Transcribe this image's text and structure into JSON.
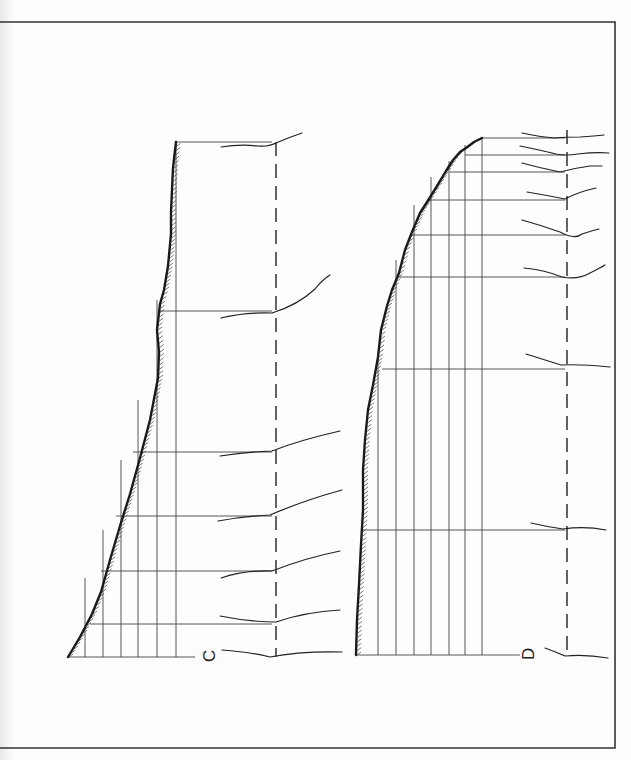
{
  "figure": {
    "frame": {
      "top_y": 22,
      "right_x": 615,
      "bottom_y": 748,
      "left_x": 0
    },
    "panels": [
      {
        "id": "C",
        "label": "C",
        "label_pos": [
          203,
          662
        ],
        "baseline": {
          "y": 657,
          "x1": 68,
          "x2": 195
        },
        "top": {
          "y": 142,
          "x1": 176,
          "x2": 272
        },
        "verticals": [
          {
            "x": 85,
            "y_top": 578
          },
          {
            "x": 103,
            "y_top": 530
          },
          {
            "x": 121,
            "y_top": 460
          },
          {
            "x": 138,
            "y_top": 400
          },
          {
            "x": 157,
            "y_top": 300
          },
          {
            "x": 176,
            "y_top": 142
          }
        ],
        "horizontals": [
          {
            "y": 142,
            "x1": 176,
            "x2": 272
          },
          {
            "y": 311,
            "x1": 160,
            "x2": 272
          },
          {
            "y": 452,
            "x1": 133,
            "x2": 272
          },
          {
            "y": 516,
            "x1": 116,
            "x2": 272
          },
          {
            "y": 571,
            "x1": 101,
            "x2": 272
          },
          {
            "y": 624,
            "x1": 90,
            "x2": 272
          }
        ],
        "profile": [
          [
            68,
            657
          ],
          [
            80,
            637
          ],
          [
            92,
            614
          ],
          [
            101,
            592
          ],
          [
            110,
            560
          ],
          [
            120,
            526
          ],
          [
            130,
            494
          ],
          [
            140,
            458
          ],
          [
            150,
            420
          ],
          [
            158,
            378
          ],
          [
            159,
            352
          ],
          [
            157,
            330
          ],
          [
            160,
            304
          ],
          [
            164,
            290
          ],
          [
            168,
            266
          ],
          [
            171,
            234
          ],
          [
            171,
            212
          ],
          [
            172,
            190
          ],
          [
            173,
            168
          ],
          [
            176,
            142
          ]
        ],
        "axis": {
          "x": 276,
          "y1": 142,
          "y2": 657
        },
        "branches": [
          "M 221 147 Q 240 144 258 146 Q 268 147 276 143 Q 290 137 302 133",
          "M 221 318 Q 245 312 272 313 Q 298 305 315 289 Q 322 280 330 275",
          "M 220 456 Q 245 452 272 451 Q 300 440 340 431",
          "M 218 521 Q 245 516 270 515 Q 305 500 342 490",
          "M 221 578 Q 245 570 272 571 Q 305 558 340 551",
          "M 220 616 Q 250 622 276 622 Q 305 612 340 610",
          "M 222 650 Q 250 652 270 657 Q 300 651 342 652"
        ]
      },
      {
        "id": "D",
        "label": "D",
        "label_pos": [
          522,
          660
        ],
        "baseline": {
          "y": 655,
          "x1": 356,
          "x2": 520
        },
        "top": {
          "y": 138,
          "x1": 482,
          "x2": 565
        },
        "verticals": [
          {
            "x": 378,
            "y_top": 357
          },
          {
            "x": 396,
            "y_top": 260
          },
          {
            "x": 414,
            "y_top": 205
          },
          {
            "x": 431,
            "y_top": 177
          },
          {
            "x": 449,
            "y_top": 161
          },
          {
            "x": 465,
            "y_top": 145
          },
          {
            "x": 482,
            "y_top": 138
          }
        ],
        "horizontals": [
          {
            "y": 138,
            "x1": 482,
            "x2": 565
          },
          {
            "y": 155,
            "x1": 465,
            "x2": 565
          },
          {
            "y": 172,
            "x1": 450,
            "x2": 565
          },
          {
            "y": 200,
            "x1": 427,
            "x2": 565
          },
          {
            "y": 235,
            "x1": 410,
            "x2": 565
          },
          {
            "y": 277,
            "x1": 398,
            "x2": 565
          },
          {
            "y": 369,
            "x1": 382,
            "x2": 565
          },
          {
            "y": 530,
            "x1": 363,
            "x2": 565
          }
        ],
        "profile": [
          [
            356,
            655
          ],
          [
            357,
            620
          ],
          [
            359,
            585
          ],
          [
            361,
            545
          ],
          [
            363,
            510
          ],
          [
            363,
            470
          ],
          [
            365,
            440
          ],
          [
            368,
            410
          ],
          [
            373,
            385
          ],
          [
            378,
            357
          ],
          [
            381,
            330
          ],
          [
            387,
            306
          ],
          [
            392,
            290
          ],
          [
            399,
            273
          ],
          [
            405,
            250
          ],
          [
            412,
            232
          ],
          [
            420,
            213
          ],
          [
            429,
            199
          ],
          [
            437,
            186
          ],
          [
            446,
            171
          ],
          [
            453,
            160
          ],
          [
            460,
            152
          ],
          [
            466,
            148
          ],
          [
            474,
            142
          ],
          [
            482,
            138
          ]
        ],
        "axis": {
          "x": 567,
          "y1": 130,
          "y2": 655
        },
        "branches": [
          "M 522 133 Q 540 137 555 138 Q 565 137 580 137 Q 595 136 604 135",
          "M 520 146 Q 540 150 556 154 Q 565 156 578 154 Q 595 152 609 153",
          "M 522 163 Q 540 168 560 172 Q 575 168 590 166 L 602 166",
          "M 527 192 Q 545 195 565 199 Q 578 192 596 188",
          "M 522 220 Q 540 225 560 232 Q 575 240 582 234 Q 594 230 599 229",
          "M 524 268 Q 545 270 562 277 Q 578 280 590 273 Q 600 268 605 265",
          "M 526 354 Q 545 360 561 365 Q 580 364 610 367",
          "M 531 523 Q 548 527 563 529 Q 585 526 606 530",
          "M 545 648 Q 556 652 565 656 Q 585 654 608 658"
        ]
      }
    ]
  }
}
